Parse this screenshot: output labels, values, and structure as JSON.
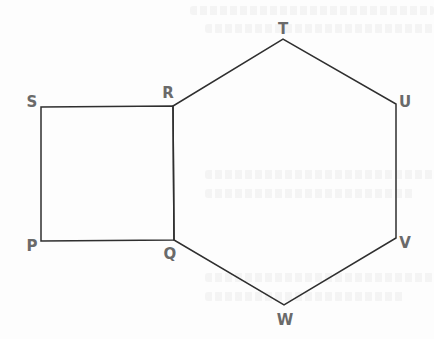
{
  "diagram": {
    "colors": {
      "edge": "#2f2f2f",
      "label": "#6a6a6a",
      "background": "#fdfdfd"
    },
    "vertices": [
      {
        "name": "S",
        "x": 41,
        "y": 107,
        "label_x": 32,
        "label_y": 107
      },
      {
        "name": "R",
        "x": 173,
        "y": 106,
        "label_x": 168,
        "label_y": 98
      },
      {
        "name": "T",
        "x": 283,
        "y": 39,
        "label_x": 283,
        "label_y": 34
      },
      {
        "name": "U",
        "x": 396,
        "y": 104,
        "label_x": 405,
        "label_y": 107
      },
      {
        "name": "V",
        "x": 396,
        "y": 238,
        "label_x": 405,
        "label_y": 248
      },
      {
        "name": "W",
        "x": 284,
        "y": 305,
        "label_x": 285,
        "label_y": 325
      },
      {
        "name": "Q",
        "x": 174,
        "y": 240,
        "label_x": 170,
        "label_y": 259
      },
      {
        "name": "P",
        "x": 41,
        "y": 241,
        "label_x": 32,
        "label_y": 251
      }
    ],
    "shapes": [
      {
        "name": "square",
        "label": "PQRS",
        "vertices": [
          "P",
          "Q",
          "R",
          "S"
        ]
      },
      {
        "name": "hexagon",
        "label": "QRTUVW",
        "vertices": [
          "Q",
          "R",
          "T",
          "U",
          "V",
          "W"
        ]
      }
    ]
  }
}
